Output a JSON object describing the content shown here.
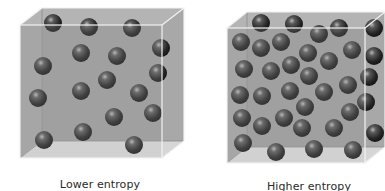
{
  "figure": {
    "panels": [
      {
        "id": "lower",
        "label": "Lower entropy",
        "label_pos": [
          100,
          178
        ],
        "front": [
          20,
          25,
          162,
          158
        ],
        "back_offset": [
          22,
          -17
        ],
        "sphere_radius": 9,
        "spheres": [
          [
            53,
            23
          ],
          [
            89,
            27
          ],
          [
            132,
            28
          ],
          [
            81,
            53
          ],
          [
            117,
            56
          ],
          [
            161,
            48
          ],
          [
            43,
            66
          ],
          [
            158,
            73
          ],
          [
            107,
            80
          ],
          [
            81,
            91
          ],
          [
            139,
            93
          ],
          [
            38,
            98
          ],
          [
            114,
            117
          ],
          [
            153,
            113
          ],
          [
            83,
            132
          ],
          [
            44,
            140
          ],
          [
            134,
            145
          ]
        ]
      },
      {
        "id": "higher",
        "label": "Higher entropy",
        "label_pos": [
          309,
          180
        ],
        "front": [
          227,
          28,
          365,
          163
        ],
        "back_offset": [
          20,
          -16
        ],
        "sphere_radius": 9,
        "spheres": [
          [
            261,
            23
          ],
          [
            294,
            24
          ],
          [
            339,
            28
          ],
          [
            374,
            28
          ],
          [
            319,
            34
          ],
          [
            241,
            42
          ],
          [
            261,
            48
          ],
          [
            281,
            42
          ],
          [
            308,
            53
          ],
          [
            352,
            50
          ],
          [
            374,
            56
          ],
          [
            244,
            69
          ],
          [
            271,
            71
          ],
          [
            291,
            65
          ],
          [
            329,
            61
          ],
          [
            309,
            76
          ],
          [
            369,
            77
          ],
          [
            348,
            85
          ],
          [
            240,
            95
          ],
          [
            262,
            96
          ],
          [
            290,
            91
          ],
          [
            324,
            92
          ],
          [
            366,
            102
          ],
          [
            305,
            107
          ],
          [
            350,
            112
          ],
          [
            242,
            118
          ],
          [
            262,
            126
          ],
          [
            284,
            118
          ],
          [
            302,
            128
          ],
          [
            334,
            128
          ],
          [
            375,
            133
          ],
          [
            243,
            143
          ],
          [
            276,
            152
          ],
          [
            314,
            149
          ],
          [
            353,
            150
          ]
        ]
      }
    ],
    "colors": {
      "background": "#ffffff",
      "cube_back_wall": "#9a9a9a",
      "cube_side_wall": "#a8a8a8",
      "cube_top": "#b4b4b4",
      "cube_floor": "#d6d6d6",
      "cube_front_tint": "#bdbdbd",
      "edge_highlight": "#f2f2f2",
      "edge_dark": "#8a8a8a",
      "sphere_dark": "#1c1c1c",
      "sphere_mid": "#4a4a4a",
      "sphere_highlight": "#b8b8b8",
      "label_text": "#2a2a2a"
    }
  }
}
